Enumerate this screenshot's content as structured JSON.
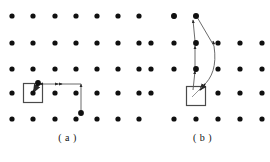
{
  "figure": {
    "type": "lattice-path-diagram",
    "background": "#ffffff",
    "width": 270,
    "height": 162,
    "dot_color": "#101010",
    "dot_radius": 2.6,
    "line_color": "#4a4a4a",
    "line_width": 0.9,
    "square_stroke": "#4a4a4a",
    "square_stroke_width": 1.2,
    "square_size": 19
  },
  "panels": [
    {
      "id": "a",
      "caption": "( a )",
      "lattice": {
        "columns_x": [
          12,
          33,
          55,
          76,
          97,
          118
        ],
        "rows_y": [
          16,
          43,
          69,
          93,
          119
        ],
        "extra_column_x": 139,
        "dot_count": 35
      },
      "target_square": {
        "cx": 33,
        "cy": 93
      },
      "path": {
        "nodes": [
          {
            "x": 81,
            "y": 113
          },
          {
            "x": 81,
            "y": 84
          },
          {
            "x": 38,
            "y": 84
          },
          {
            "x": 33,
            "y": 93
          }
        ],
        "arrow_points": [
          "up",
          "left",
          "down-left"
        ],
        "start_label": "start-dot",
        "end_label": "target-dot"
      }
    },
    {
      "id": "b",
      "caption": "( b )",
      "lattice": {
        "columns_x": [
          151,
          174,
          196,
          218,
          240,
          262
        ],
        "rows_y": [
          16,
          43,
          69,
          93,
          119
        ],
        "dot_count": 26
      },
      "target_square": {
        "cx": 192,
        "cy": 96
      },
      "path": {
        "nodes": [
          {
            "x": 192,
            "y": 91
          },
          {
            "x": 196,
            "y": 69
          },
          {
            "x": 196,
            "y": 43
          },
          {
            "x": 194,
            "y": 17
          },
          {
            "x": 214,
            "y": 43
          },
          {
            "x": 201,
            "y": 88
          }
        ],
        "arrow_points": [
          "up",
          "up",
          "up",
          "down-left"
        ],
        "start_label": "start-dot",
        "end_label": "target-dot"
      }
    }
  ]
}
